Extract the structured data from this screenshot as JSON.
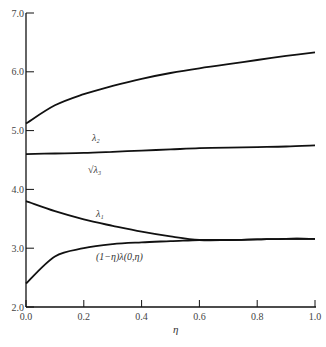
{
  "chart_data": {
    "type": "line",
    "title": "",
    "xlabel": "η",
    "ylabel": "",
    "xlim": [
      0.0,
      1.0
    ],
    "ylim": [
      2.0,
      7.0
    ],
    "grid": false,
    "legend": "none (inline curve labels)",
    "x_ticks": [
      "0.0",
      "0.2",
      "0.4",
      "0.6",
      "0.8",
      "1.0"
    ],
    "y_ticks": [
      "2.0",
      "3.0",
      "4.0",
      "5.0",
      "6.0",
      "7.0"
    ],
    "x": [
      0.0,
      0.1,
      0.2,
      0.3,
      0.4,
      0.5,
      0.6,
      0.7,
      0.8,
      0.9,
      1.0
    ],
    "series": [
      {
        "name": "λ̲2",
        "label": "λ₂",
        "values": [
          5.12,
          5.43,
          5.62,
          5.76,
          5.88,
          5.98,
          6.06,
          6.13,
          6.2,
          6.27,
          6.33
        ]
      },
      {
        "name": "√λ̲3",
        "label": "√λ₃",
        "values": [
          4.6,
          4.61,
          4.62,
          4.64,
          4.66,
          4.68,
          4.7,
          4.71,
          4.72,
          4.73,
          4.75
        ]
      },
      {
        "name": "λ̲1",
        "label": "λ₁",
        "values": [
          3.8,
          3.63,
          3.49,
          3.38,
          3.28,
          3.2,
          3.14,
          3.14,
          3.15,
          3.16,
          3.16
        ]
      },
      {
        "name": "(1−η)λ̲(0,η)",
        "label": "(1−η)λ(0,η)",
        "values": [
          2.4,
          2.86,
          3.0,
          3.07,
          3.1,
          3.12,
          3.14,
          3.14,
          3.15,
          3.16,
          3.16
        ]
      }
    ],
    "annotations": [
      {
        "text": "λ₂",
        "near_x": 0.22,
        "near_y": 5.45
      },
      {
        "text": "√λ₃",
        "near_x": 0.2,
        "near_y": 4.45
      },
      {
        "text": "λ₁",
        "near_x": 0.2,
        "near_y": 3.55
      },
      {
        "text": "(1−η)λ(0,η)",
        "near_x": 0.27,
        "near_y": 2.85
      }
    ]
  },
  "labels": {
    "x_axis": "η",
    "lambda2": "λ₂",
    "lambda3_sqrt": "√λ₃",
    "lambda1": "λ₁",
    "lambda_zero": "(1−η)λ(0,η)"
  }
}
